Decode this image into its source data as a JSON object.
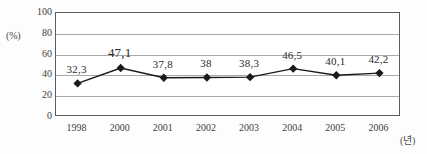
{
  "chart_data": {
    "type": "line",
    "title": "",
    "xlabel": "(년)",
    "ylabel": "(%)",
    "ylim": [
      0,
      100
    ],
    "ytick_values": [
      100,
      80,
      60,
      40,
      20,
      0
    ],
    "ytick_labels": [
      "100",
      "80",
      "60",
      "40",
      "20",
      "0"
    ],
    "grid": true,
    "grid_orientation": "horizontal",
    "legend": "none",
    "marker": "diamond",
    "marker_color": "#1a1a1a",
    "line_color": "#1a1a1a",
    "categories": [
      "1998",
      "2000",
      "2001",
      "2002",
      "2003",
      "2004",
      "2005",
      "2006"
    ],
    "values": [
      32.3,
      47.1,
      37.8,
      38,
      38.3,
      46.5,
      40.1,
      42.2
    ],
    "data_labels": [
      "32,3",
      "47,1",
      "37,8",
      "38",
      "38,3",
      "46,5",
      "40,1",
      "42,2"
    ],
    "points": [
      {
        "category": "1998",
        "value": 32.3,
        "label": "32,3"
      },
      {
        "category": "2000",
        "value": 47.1,
        "label": "47,1"
      },
      {
        "category": "2001",
        "value": 37.8,
        "label": "37,8"
      },
      {
        "category": "2002",
        "value": 38,
        "label": "38"
      },
      {
        "category": "2003",
        "value": 38.3,
        "label": "38,3"
      },
      {
        "category": "2004",
        "value": 46.5,
        "label": "46,5"
      },
      {
        "category": "2005",
        "value": 40.1,
        "label": "40,1"
      },
      {
        "category": "2006",
        "value": 42.2,
        "label": "42,2"
      }
    ]
  }
}
